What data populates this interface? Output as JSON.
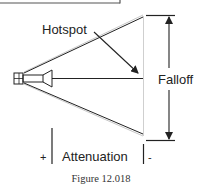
{
  "diagram": {
    "labels": {
      "hotspot": "Hotspot",
      "falloff": "Falloff",
      "attenuation": "Attenuation",
      "plus": "+",
      "minus": "-"
    },
    "caption": "Figure 12.018",
    "icons": {
      "spotlight": "spotlight-icon"
    },
    "colors": {
      "line": "#222222",
      "hotspot_line": "#bbbbbb",
      "edge_line": "#cccccc",
      "text": "#222222"
    }
  }
}
